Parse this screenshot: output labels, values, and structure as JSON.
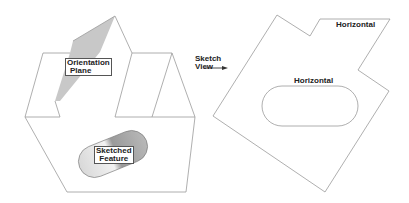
{
  "figure": {
    "left_view": {
      "labels": {
        "orientation_plane_line1": "Orientation",
        "orientation_plane_line2": "Plane",
        "sketched_feature_line1": "Sketched",
        "sketched_feature_line2": "Feature"
      }
    },
    "arrow_label": {
      "line1": "Sketch",
      "line2": "View"
    },
    "right_view": {
      "labels": {
        "top_edge": "Horizontal",
        "slot_top_edge": "Horizontal"
      }
    },
    "colors": {
      "line": "#9a9a9a",
      "plane_fill": "#c8c8c8",
      "text": "#222222"
    }
  }
}
